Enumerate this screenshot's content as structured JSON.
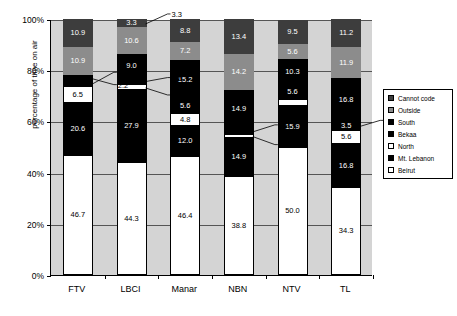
{
  "chart_data": {
    "type": "bar",
    "subtype": "stacked-100-percent",
    "title": "",
    "xlabel": "",
    "ylabel": "percentage of time on air",
    "ylim": [
      0,
      100
    ],
    "ytick_labels": [
      "0%",
      "20%",
      "40%",
      "60%",
      "80%",
      "100%"
    ],
    "ytick_values": [
      0,
      20,
      40,
      60,
      80,
      100
    ],
    "grid": true,
    "legend_position": "right",
    "categories": [
      "FTV",
      "LBCI",
      "Manar",
      "NBN",
      "NTV",
      "TL"
    ],
    "series": [
      {
        "name": "Beirut",
        "color": "#ffffff",
        "values": [
          46.7,
          44.3,
          46.4,
          38.8,
          50.0,
          34.3
        ]
      },
      {
        "name": "Mt. Lebanon",
        "color": "#000000",
        "values": [
          20.6,
          27.9,
          12.0,
          14.9,
          15.9,
          16.8
        ]
      },
      {
        "name": "North",
        "color": "#ffffff",
        "values": [
          6.5,
          2.5,
          4.8,
          1.5,
          2.7,
          5.6
        ]
      },
      {
        "name": "Bekaa",
        "color": "#000000",
        "values": [
          2.2,
          2.5,
          5.6,
          2.2,
          5.6,
          3.5
        ]
      },
      {
        "name": "South",
        "color": "#000000",
        "values": [
          2.2,
          9.0,
          15.2,
          14.9,
          10.3,
          16.8
        ]
      },
      {
        "name": "Outside",
        "color": "#8c8c8c",
        "values": [
          10.9,
          10.6,
          7.2,
          14.2,
          5.6,
          11.9
        ]
      },
      {
        "name": "Cannot code",
        "color": "#3d3d3d",
        "values": [
          10.9,
          3.3,
          8.8,
          13.4,
          9.5,
          11.2
        ]
      }
    ],
    "bar_labels": {
      "FTV": [
        "46.7",
        "20.6",
        "6.5",
        "2.2",
        "2.2",
        "10.9",
        "10.9"
      ],
      "LBCI": [
        "44.3",
        "27.9",
        "2.5",
        "2.5",
        "9.0",
        "10.6",
        "3.3"
      ],
      "Manar": [
        "46.4",
        "12.0",
        "4.8",
        "5.6",
        "15.2",
        "7.2",
        "8.8"
      ],
      "NBN": [
        "38.8",
        "14.9",
        "1.5",
        "2.2",
        "14.9",
        "14.2",
        "13.4"
      ],
      "NTV": [
        "50.0",
        "15.9",
        "",
        "5.6",
        "10.3",
        "5.6",
        "9.5"
      ],
      "TL": [
        "34.3",
        "16.8",
        "5.6",
        "3.5",
        "16.8",
        "11.9",
        "11.2"
      ]
    },
    "callouts": [
      {
        "text": "2.2",
        "series": "Bekaa",
        "category": "FTV"
      },
      {
        "text": "2.2",
        "series": "South",
        "category": "FTV"
      },
      {
        "text": "3.3",
        "series": "Cannot code",
        "category": "LBCI"
      },
      {
        "text": "2.5",
        "series": "Bekaa",
        "category": "LBCI"
      },
      {
        "text": "2.5",
        "series": "North",
        "category": "LBCI"
      },
      {
        "text": "2.2",
        "series": "Bekaa",
        "category": "NBN"
      },
      {
        "text": "1.5",
        "series": "North",
        "category": "NBN"
      },
      {
        "text": "3.5",
        "series": "Bekaa",
        "category": "TL"
      }
    ]
  },
  "legend": {
    "items": [
      {
        "label": "Cannot code",
        "color": "#3d3d3d"
      },
      {
        "label": "Outside",
        "color": "#8c8c8c"
      },
      {
        "label": "South",
        "color": "#000000"
      },
      {
        "label": "Bekaa",
        "color": "#000000"
      },
      {
        "label": "North",
        "color": "#ffffff"
      },
      {
        "label": "Mt. Lebanon",
        "color": "#000000"
      },
      {
        "label": "Beirut",
        "color": "#ffffff"
      }
    ]
  },
  "axes": {
    "y_title": "percentage of time on air",
    "y_ticks": [
      "100%",
      "80%",
      "60%",
      "40%",
      "20%",
      "0%"
    ],
    "x_ticks": [
      "FTV",
      "LBCI",
      "Manar",
      "NBN",
      "NTV",
      "TL"
    ]
  }
}
